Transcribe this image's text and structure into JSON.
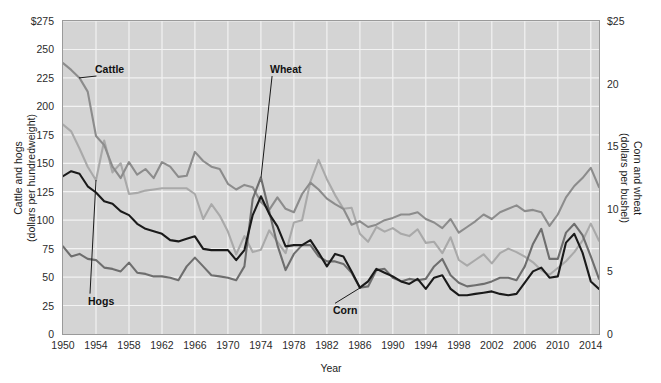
{
  "chart_data": {
    "type": "line",
    "title": "",
    "subtitle": "",
    "xlabel": "Year",
    "ylabel": "Cattle and hogs\n(dollars per hundredweight)",
    "ylabel_left_line1": "Cattle and hogs",
    "ylabel_left_line2": "(dollars per hundredweight)",
    "ylabel_right_line1": "Corn and wheat",
    "ylabel_right_line2": "(dollars per bushel)",
    "grid": true,
    "legend_position": "inline-annotations",
    "plot_background": "#d4d4d4",
    "gridline_color": "#f2f2f2",
    "frame_color": "#9a9a9a",
    "xlim": [
      1950,
      2015
    ],
    "x_tick_labels": [
      "1950",
      "1954",
      "1958",
      "1962",
      "1966",
      "1970",
      "1974",
      "1978",
      "1982",
      "1986",
      "1990",
      "1994",
      "1998",
      "2002",
      "2006",
      "2010",
      "2014"
    ],
    "x_tick_values": [
      1950,
      1954,
      1958,
      1962,
      1966,
      1970,
      1974,
      1978,
      1982,
      1986,
      1990,
      1994,
      1998,
      2002,
      2006,
      2010,
      2014
    ],
    "left_axis": {
      "label_line1": "Cattle and hogs",
      "label_line2": "(dollars per hundredweight)",
      "ylim": [
        0,
        275
      ],
      "tick_values": [
        0,
        25,
        50,
        75,
        100,
        125,
        150,
        175,
        200,
        225,
        250,
        275
      ],
      "tick_labels": [
        "0",
        "25",
        "50",
        "75",
        "100",
        "125",
        "150",
        "175",
        "200",
        "225",
        "250",
        "$275"
      ],
      "units": "dollars per hundredweight"
    },
    "right_axis": {
      "label_line1": "Corn and wheat",
      "label_line2": "(dollars per bushel)",
      "ylim": [
        0,
        25
      ],
      "tick_values": [
        0,
        5,
        10,
        15,
        20,
        25
      ],
      "tick_labels": [
        "0",
        "5",
        "10",
        "15",
        "20",
        "$25"
      ],
      "units": "dollars per bushel"
    },
    "x": [
      1950,
      1951,
      1952,
      1953,
      1954,
      1955,
      1956,
      1957,
      1958,
      1959,
      1960,
      1961,
      1962,
      1963,
      1964,
      1965,
      1966,
      1967,
      1968,
      1969,
      1970,
      1971,
      1972,
      1973,
      1974,
      1975,
      1976,
      1977,
      1978,
      1979,
      1980,
      1981,
      1982,
      1983,
      1984,
      1985,
      1986,
      1987,
      1988,
      1989,
      1990,
      1991,
      1992,
      1993,
      1994,
      1995,
      1996,
      1997,
      1998,
      1999,
      2000,
      2001,
      2002,
      2003,
      2004,
      2005,
      2006,
      2007,
      2008,
      2009,
      2010,
      2011,
      2012,
      2013,
      2014,
      2015
    ],
    "series": [
      {
        "name": "Cattle",
        "axis": "left",
        "color": "#8c8c8c",
        "units": "dollars per hundredweight",
        "values": [
          238,
          232,
          225,
          213,
          174,
          166,
          147,
          137,
          151,
          140,
          145,
          137,
          151,
          147,
          138,
          139,
          160,
          152,
          147,
          145,
          132,
          127,
          131,
          129,
          116,
          109,
          120,
          110,
          107,
          123,
          133,
          127,
          119,
          114,
          110,
          96,
          99,
          94,
          96,
          100,
          102,
          105,
          105,
          107,
          101,
          98,
          93,
          101,
          89,
          94,
          99,
          105,
          101,
          107,
          110,
          113,
          108,
          109,
          107,
          95,
          105,
          120,
          130,
          137,
          146,
          129
        ]
      },
      {
        "name": "Hogs",
        "axis": "left",
        "color": "#a9a9a9",
        "units": "dollars per hundredweight",
        "values": [
          184,
          178,
          163,
          147,
          135,
          170,
          142,
          150,
          123,
          124,
          126,
          127,
          128,
          128,
          128,
          128,
          123,
          101,
          114,
          104,
          90,
          70,
          86,
          72,
          74,
          91,
          81,
          71,
          98,
          100,
          134,
          153,
          136,
          122,
          110,
          111,
          88,
          81,
          94,
          90,
          93,
          88,
          86,
          92,
          80,
          81,
          71,
          85,
          65,
          60,
          65,
          70,
          62,
          71,
          75,
          72,
          68,
          63,
          56,
          52,
          58,
          64,
          72,
          82,
          97,
          82
        ]
      },
      {
        "name": "Wheat",
        "axis": "right",
        "color": "#6e6e6e",
        "units": "dollars per bushel",
        "values": [
          7.0,
          6.2,
          6.4,
          6.0,
          5.9,
          5.3,
          5.2,
          5.0,
          5.7,
          4.9,
          4.8,
          4.6,
          4.6,
          4.5,
          4.3,
          5.4,
          6.1,
          5.4,
          4.7,
          4.6,
          4.5,
          4.3,
          5.4,
          10.8,
          12.5,
          9.8,
          7.1,
          5.1,
          6.4,
          7.1,
          7.1,
          6.2,
          5.8,
          5.8,
          5.6,
          4.9,
          3.7,
          3.8,
          5.1,
          5.2,
          4.5,
          4.2,
          4.4,
          4.3,
          4.4,
          5.4,
          6.0,
          4.7,
          4.1,
          3.8,
          3.9,
          4.0,
          4.2,
          4.5,
          4.5,
          4.3,
          5.4,
          7.2,
          8.4,
          6.0,
          6.0,
          8.1,
          8.8,
          7.9,
          6.2,
          4.4
        ]
      },
      {
        "name": "Corn",
        "axis": "right",
        "color": "#1a1a1a",
        "units": "dollars per bushel",
        "values": [
          12.6,
          13.0,
          12.8,
          11.8,
          11.3,
          10.6,
          10.4,
          9.8,
          9.5,
          8.8,
          8.4,
          8.2,
          8.0,
          7.5,
          7.4,
          7.6,
          7.8,
          6.8,
          6.7,
          6.7,
          6.7,
          5.9,
          6.7,
          9.5,
          11.0,
          9.6,
          8.6,
          7.0,
          7.1,
          7.1,
          7.5,
          6.5,
          5.4,
          6.4,
          6.2,
          5.0,
          3.7,
          4.2,
          5.2,
          4.9,
          4.6,
          4.2,
          4.0,
          4.4,
          3.6,
          4.5,
          4.7,
          3.6,
          3.1,
          3.1,
          3.2,
          3.3,
          3.4,
          3.2,
          3.1,
          3.2,
          4.1,
          5.0,
          5.3,
          4.5,
          4.6,
          7.3,
          8.0,
          6.5,
          4.2,
          3.6
        ]
      }
    ],
    "annotations": [
      {
        "label": "Cattle",
        "series": "Cattle",
        "x": 1952,
        "label_x_px": 95,
        "label_y_px": 64
      },
      {
        "label": "Wheat",
        "series": "Wheat",
        "x": 1974,
        "label_x_px": 270,
        "label_y_px": 64
      },
      {
        "label": "Hogs",
        "series": "Hogs",
        "x": 1954,
        "label_x_px": 88,
        "label_y_px": 296
      },
      {
        "label": "Corn",
        "series": "Corn",
        "x": 1986,
        "label_x_px": 333,
        "label_y_px": 305
      }
    ]
  }
}
